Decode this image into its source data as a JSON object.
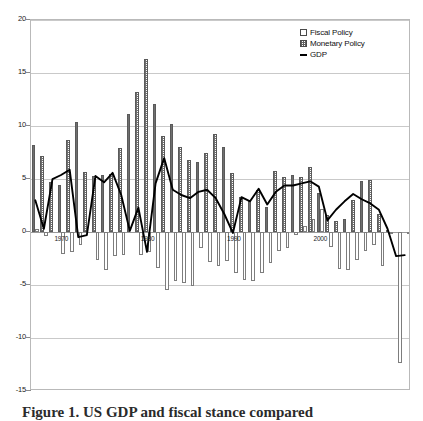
{
  "chart_data": {
    "type": "bar",
    "title": "",
    "xlabel": "",
    "ylabel": "",
    "ylim": [
      -15,
      20
    ],
    "yticks": [
      20,
      15,
      10,
      5,
      0,
      -5,
      -10,
      -15
    ],
    "ytick_labels": [
      "20",
      "15",
      "10",
      "5",
      "0",
      "-5",
      "-10",
      "-15"
    ],
    "xlim": [
      1966.5,
      2010.5
    ],
    "xticks": [
      1970,
      1980,
      1990,
      2000
    ],
    "xtick_labels": [
      "1970",
      "1980",
      "1990",
      "2000"
    ],
    "grid": true,
    "legend_position": "top-right",
    "legend": [
      "Fiscal Policy",
      "Monetary Policy",
      "GDP"
    ],
    "x": [
      1967,
      1968,
      1969,
      1970,
      1971,
      1972,
      1973,
      1974,
      1975,
      1976,
      1977,
      1978,
      1979,
      1980,
      1981,
      1982,
      1983,
      1984,
      1985,
      1986,
      1987,
      1988,
      1989,
      1990,
      1991,
      1992,
      1993,
      1994,
      1995,
      1996,
      1997,
      1998,
      1999,
      2000,
      2001,
      2002,
      2003,
      2004,
      2005,
      2006,
      2007,
      2008,
      2009,
      2010
    ],
    "series": [
      {
        "name": "Fiscal Policy",
        "style": "bar-white",
        "values": [
          0.3,
          -0.4,
          0.0,
          -2.1,
          -1.9,
          -1.2,
          0.0,
          -2.6,
          -3.6,
          -2.3,
          -2.2,
          0.0,
          -2.2,
          -1.9,
          -3.4,
          -5.5,
          -4.6,
          -4.8,
          -5.1,
          -1.5,
          -2.8,
          -3.2,
          -2.7,
          -3.9,
          -4.5,
          -4.6,
          -3.9,
          -2.9,
          -1.8,
          -1.5,
          -0.3,
          0.6,
          1.2,
          2.2,
          -1.4,
          -3.5,
          -3.6,
          -2.6,
          -1.8,
          -1.2,
          -3.2,
          -0.1,
          -12.4,
          -0.1
        ]
      },
      {
        "name": "Monetary Policy",
        "style": "bar-hatched",
        "values": [
          8.2,
          7.2,
          4.7,
          4.4,
          8.7,
          10.4,
          5.7,
          5.3,
          5.4,
          5.5,
          7.9,
          11.1,
          13.2,
          16.3,
          12.1,
          9.1,
          10.2,
          8.0,
          6.8,
          6.6,
          7.5,
          9.2,
          8.0,
          5.6,
          3.3,
          2.9,
          4.0,
          2.4,
          5.8,
          5.2,
          5.4,
          5.2,
          6.1,
          3.7,
          1.6,
          1.0,
          1.2,
          3.0,
          4.8,
          4.9,
          1.7,
          0.2,
          0.0,
          0.0
        ]
      },
      {
        "name": "GDP",
        "style": "line",
        "values": [
          2.9,
          0.2,
          4.9,
          5.3,
          5.8,
          -0.6,
          -0.4,
          5.2,
          4.6,
          5.5,
          3.4,
          0.0,
          2.2,
          -2.0,
          4.5,
          6.9,
          3.9,
          3.4,
          3.1,
          3.7,
          3.9,
          3.1,
          1.6,
          -0.2,
          3.2,
          2.8,
          4.0,
          2.5,
          3.7,
          4.3,
          4.3,
          4.5,
          4.7,
          4.2,
          1.0,
          2.0,
          2.8,
          3.5,
          3.0,
          2.6,
          2.0,
          0.2,
          -2.4,
          -2.3
        ]
      }
    ]
  },
  "legend": {
    "items": [
      {
        "label": "Fiscal Policy",
        "marker": "white-square"
      },
      {
        "label": "Monetary Policy",
        "marker": "hatched-square"
      },
      {
        "label": "GDP",
        "marker": "black-line"
      }
    ]
  },
  "caption": {
    "text": "Figure 1. US GDP and fiscal stance compared"
  },
  "colors": {
    "axis": "#b9b9b9",
    "grid": "#c9c9c9",
    "zero_line": "#9a9a9a",
    "line": "#000000",
    "bar_fiscal_fill": "#ffffff",
    "bar_fiscal_border": "#7d7d7d",
    "bar_monetary_hatch": "#6f6f6f",
    "bar_monetary_border": "#5a5a5a",
    "text": "#1a1a1a",
    "background": "#ffffff"
  }
}
